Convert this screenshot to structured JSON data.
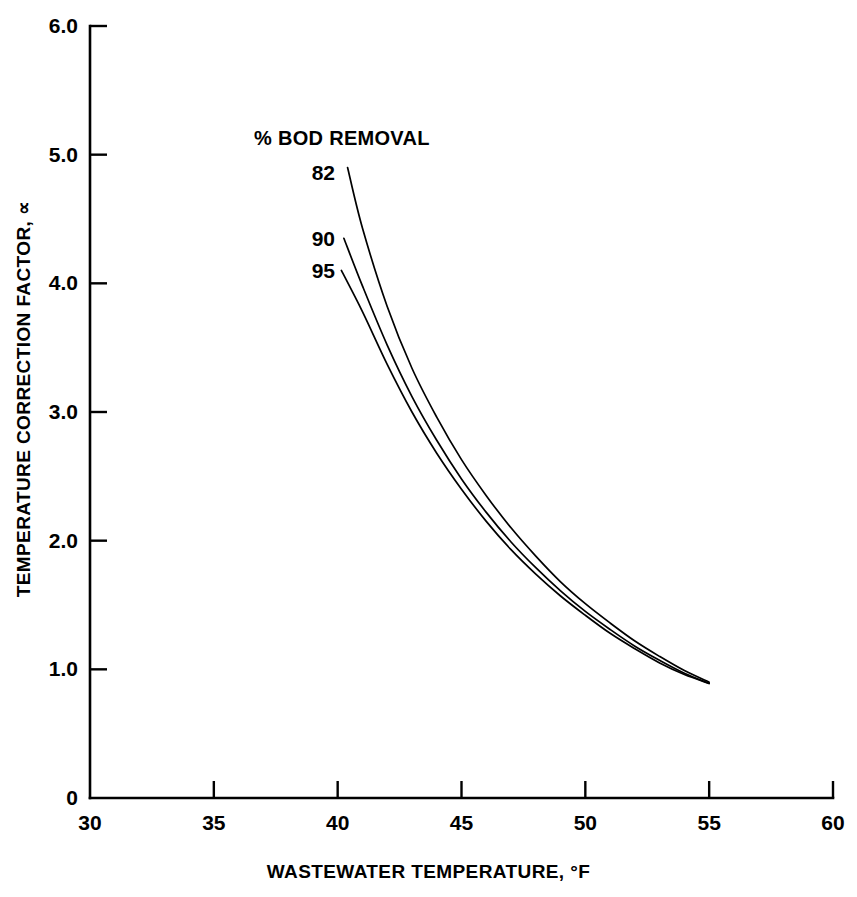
{
  "chart_data": {
    "type": "line",
    "title": "",
    "xlabel": "WASTEWATER TEMPERATURE, °F",
    "ylabel": "TEMPERATURE CORRECTION FACTOR, ∝",
    "legend_title": "% BOD REMOVAL",
    "legend_position": "inline-left-of-curves",
    "grid": false,
    "xlim": [
      30,
      60
    ],
    "ylim": [
      0,
      6.0
    ],
    "xticks": [
      30,
      35,
      40,
      45,
      50,
      55,
      60
    ],
    "xtick_labels": [
      "30",
      "35",
      "40",
      "45",
      "50",
      "55",
      "60"
    ],
    "yticks": [
      0,
      1.0,
      2.0,
      3.0,
      4.0,
      5.0,
      6.0
    ],
    "ytick_labels": [
      "0",
      "1.0",
      "2.0",
      "3.0",
      "4.0",
      "5.0",
      "6.0"
    ],
    "line_color": "#000000",
    "line_width": 1.7,
    "series": [
      {
        "name": "82",
        "label": "82",
        "x": [
          40.4,
          41.0,
          42.0,
          43.0,
          44.0,
          45.0,
          46.0,
          47.0,
          48.0,
          49.0,
          50.0,
          51.0,
          52.0,
          53.0,
          54.0,
          55.0
        ],
        "values": [
          4.9,
          4.43,
          3.82,
          3.34,
          2.96,
          2.63,
          2.35,
          2.1,
          1.88,
          1.68,
          1.51,
          1.36,
          1.22,
          1.1,
          0.99,
          0.9
        ]
      },
      {
        "name": "90",
        "label": "90",
        "x": [
          40.25,
          41.0,
          42.0,
          43.0,
          44.0,
          45.0,
          46.0,
          47.0,
          48.0,
          49.0,
          50.0,
          51.0,
          52.0,
          53.0,
          54.0,
          55.0
        ],
        "values": [
          4.35,
          3.98,
          3.52,
          3.12,
          2.78,
          2.48,
          2.22,
          1.99,
          1.79,
          1.61,
          1.45,
          1.31,
          1.18,
          1.07,
          0.97,
          0.89
        ]
      },
      {
        "name": "95",
        "label": "95",
        "x": [
          40.15,
          41.0,
          42.0,
          43.0,
          44.0,
          45.0,
          46.0,
          47.0,
          48.0,
          49.0,
          50.0,
          51.0,
          52.0,
          53.0,
          54.0,
          55.0
        ],
        "values": [
          4.1,
          3.78,
          3.37,
          3.0,
          2.68,
          2.4,
          2.15,
          1.93,
          1.74,
          1.57,
          1.42,
          1.28,
          1.16,
          1.05,
          0.96,
          0.89
        ]
      }
    ],
    "series_label_positions": [
      {
        "name": "82",
        "x_px": 335,
        "y_px": 172
      },
      {
        "name": "90",
        "x_px": 335,
        "y_px": 238
      },
      {
        "name": "95",
        "x_px": 335,
        "y_px": 270
      }
    ]
  },
  "axes": {
    "x_title": "WASTEWATER TEMPERATURE, °F",
    "y_title": "TEMPERATURE CORRECTION FACTOR, ∝",
    "x_ticks": [
      {
        "value": 30,
        "label": "30",
        "px": 90
      },
      {
        "value": 35,
        "label": "35",
        "px": 214
      },
      {
        "value": 40,
        "label": "40",
        "px": 338
      },
      {
        "value": 45,
        "label": "45",
        "px": 462
      },
      {
        "value": 50,
        "label": "50",
        "px": 586
      },
      {
        "value": 55,
        "label": "55",
        "px": 710
      },
      {
        "value": 60,
        "label": "60",
        "px": 833
      }
    ],
    "y_ticks": [
      {
        "value": 6.0,
        "label": "6.0",
        "px": 26
      },
      {
        "value": 5.0,
        "label": "5.0",
        "px": 155
      },
      {
        "value": 4.0,
        "label": "4.0",
        "px": 283
      },
      {
        "value": 3.0,
        "label": "3.0",
        "px": 412
      },
      {
        "value": 2.0,
        "label": "2.0",
        "px": 540
      },
      {
        "value": 1.0,
        "label": "1.0",
        "px": 669
      },
      {
        "value": 0,
        "label": "0",
        "px": 798
      }
    ]
  },
  "legend": {
    "title": "% BOD REMOVAL",
    "entries": [
      "82",
      "90",
      "95"
    ]
  }
}
